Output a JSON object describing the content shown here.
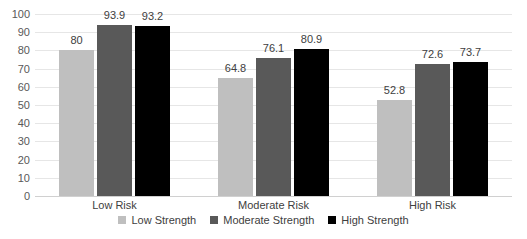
{
  "chart_data": {
    "type": "bar",
    "title": "",
    "xlabel": "",
    "ylabel": "",
    "ylim": [
      0,
      100
    ],
    "ytick_step": 10,
    "yticks": [
      "100",
      "90",
      "80",
      "70",
      "60",
      "50",
      "40",
      "30",
      "20",
      "10",
      "0"
    ],
    "grid": true,
    "legend_position": "bottom-center",
    "categories": [
      "Low Risk",
      "Moderate Risk",
      "High Risk"
    ],
    "series": [
      {
        "name": "Low Strength",
        "color": "#bfbfbf",
        "values": [
          80,
          64.8,
          52.8
        ],
        "labels": [
          "80",
          "64.8",
          "52.8"
        ]
      },
      {
        "name": "Moderate Strength",
        "color": "#595959",
        "values": [
          93.9,
          76.1,
          72.6
        ],
        "labels": [
          "93.9",
          "76.1",
          "72.6"
        ]
      },
      {
        "name": "High Strength",
        "color": "#000000",
        "values": [
          93.2,
          80.9,
          73.7
        ],
        "labels": [
          "93.2",
          "80.9",
          "73.7"
        ]
      }
    ]
  },
  "legend": {
    "items": [
      {
        "label": "Low Strength",
        "color": "#bfbfbf"
      },
      {
        "label": "Moderate Strength",
        "color": "#595959"
      },
      {
        "label": "High Strength",
        "color": "#000000"
      }
    ]
  },
  "axis": {
    "y_labels": [
      "100",
      "90",
      "80",
      "70",
      "60",
      "50",
      "40",
      "30",
      "20",
      "10",
      "0"
    ],
    "x_labels": [
      "Low Risk",
      "Moderate Risk",
      "High Risk"
    ]
  },
  "colors": {
    "gridline": "#e6e6e6",
    "baseline": "#d0d0d0",
    "background": "#ffffff",
    "text": "#404040"
  }
}
